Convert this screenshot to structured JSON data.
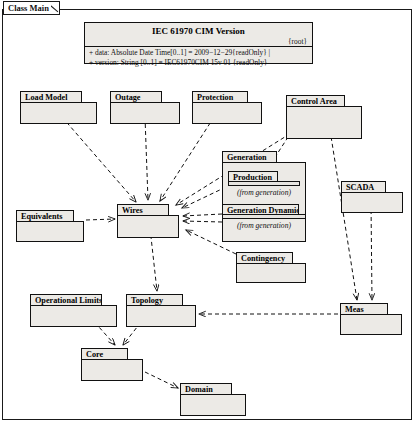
{
  "frame": {
    "label": "Class Main"
  },
  "version_box": {
    "title": "IEC 61970 CIM Version",
    "stereotype": "{root}",
    "attributes": [
      "+ data: Absolute Date Time[0..1] = 2009−12−29{readOnly} |",
      "+ version: String [0..1] = IEC61970CIM 15v 01 {readOnly}"
    ]
  },
  "packages": [
    {
      "name": "Load Model",
      "x": 20,
      "y": 91,
      "tab_w": 62,
      "tab_h": 12,
      "body_w": 77,
      "body_h": 22
    },
    {
      "name": "Outage",
      "x": 110,
      "y": 91,
      "tab_w": 52,
      "tab_h": 12,
      "body_w": 70,
      "body_h": 22
    },
    {
      "name": "Protection",
      "x": 192,
      "y": 91,
      "tab_w": 56,
      "tab_h": 12,
      "body_w": 70,
      "body_h": 22
    },
    {
      "name": "Control Area",
      "x": 286,
      "y": 95,
      "tab_w": 59,
      "tab_h": 12,
      "body_w": 76,
      "body_h": 33
    },
    {
      "name": "Generation",
      "x": 222,
      "y": 151,
      "tab_w": 55,
      "tab_h": 12,
      "body_w": 84,
      "body_h": 80
    },
    {
      "name": "Production",
      "x": 228,
      "y": 171,
      "tab_w": 50,
      "tab_h": 11,
      "body_w": 72,
      "body_h": 5,
      "from": "(from generation)",
      "nested": true
    },
    {
      "name": "Generation Dynamics",
      "x": 222,
      "y": 204,
      "tab_w": 77,
      "tab_h": 11,
      "body_w": 84,
      "body_h": 5,
      "from": "(from generation)",
      "nested": true
    },
    {
      "name": "SCADA",
      "x": 341,
      "y": 181,
      "tab_w": 45,
      "tab_h": 12,
      "body_w": 62,
      "body_h": 21
    },
    {
      "name": "Wires",
      "x": 117,
      "y": 204,
      "tab_w": 52,
      "tab_h": 12,
      "body_w": 62,
      "body_h": 23
    },
    {
      "name": "Equivalents",
      "x": 16,
      "y": 210,
      "tab_w": 58,
      "tab_h": 12,
      "body_w": 68,
      "body_h": 21
    },
    {
      "name": "Contingency",
      "x": 236,
      "y": 252,
      "tab_w": 57,
      "tab_h": 12,
      "body_w": 70,
      "body_h": 20
    },
    {
      "name": "Operational Limits",
      "x": 30,
      "y": 294,
      "tab_w": 72,
      "tab_h": 12,
      "body_w": 87,
      "body_h": 22
    },
    {
      "name": "Topology",
      "x": 126,
      "y": 294,
      "tab_w": 57,
      "tab_h": 12,
      "body_w": 70,
      "body_h": 22
    },
    {
      "name": "Meas",
      "x": 340,
      "y": 303,
      "tab_w": 48,
      "tab_h": 12,
      "body_w": 62,
      "body_h": 21
    },
    {
      "name": "Core",
      "x": 81,
      "y": 348,
      "tab_w": 47,
      "tab_h": 12,
      "body_w": 62,
      "body_h": 22
    },
    {
      "name": "Domain",
      "x": 180,
      "y": 383,
      "tab_w": 52,
      "tab_h": 12,
      "body_w": 66,
      "body_h": 22
    }
  ],
  "edges": [
    {
      "from": "Load Model",
      "to": "Wires",
      "d": "M 62 117 L 136 202"
    },
    {
      "from": "Outage",
      "to": "Wires",
      "d": "M 145 117 L 148 200"
    },
    {
      "from": "Protection",
      "to": "Wires",
      "d": "M 214 117 L 160 201"
    },
    {
      "from": "Control Area",
      "to": "Wires",
      "d": "M 296 130 L 176 205"
    },
    {
      "from": "Control Area",
      "to": "Meas",
      "d": "M 330 130 L 357 300"
    },
    {
      "from": "Control Area",
      "to": "Production",
      "d": "M 292 131 L 268 168"
    },
    {
      "from": "Production",
      "to": "Wires",
      "d": "M 226 187 L 182 208"
    },
    {
      "from": "Generation Dynamics",
      "to": "Wires",
      "d": "M 222 214 L 183 216"
    },
    {
      "from": "Generation",
      "to": "Wires",
      "d": "M 222 222 L 183 221"
    },
    {
      "from": "Equivalents",
      "to": "Wires",
      "d": "M 86 220 L 115 219"
    },
    {
      "from": "Contingency",
      "to": "Wires",
      "d": "M 236 254 L 186 230"
    },
    {
      "from": "SCADA",
      "to": "Meas",
      "d": "M 371 203 L 372 300"
    },
    {
      "from": "Wires",
      "to": "Topology",
      "d": "M 150 228 L 157 291"
    },
    {
      "from": "Meas",
      "to": "Topology",
      "d": "M 338 314 L 199 314"
    },
    {
      "from": "Operational Limits",
      "to": "Core",
      "d": "M 90 317 L 115 345"
    },
    {
      "from": "Topology",
      "to": "Core",
      "d": "M 145 317 L 123 345"
    },
    {
      "from": "Core",
      "to": "Domain",
      "d": "M 145 372 L 178 388"
    }
  ]
}
